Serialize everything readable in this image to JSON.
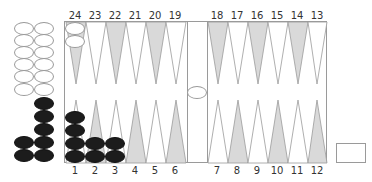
{
  "colors": {
    "gray_point": "#d9d9d9",
    "white_point": "#ffffff",
    "line": "#9a9a9a",
    "black_checker": "#1c1c1c",
    "white_checker": "#ffffff"
  },
  "top_labels": [
    "24",
    "23",
    "22",
    "21",
    "20",
    "19",
    "18",
    "17",
    "16",
    "15",
    "14",
    "13"
  ],
  "bottom_labels": [
    "1",
    "2",
    "3",
    "4",
    "5",
    "6",
    "7",
    "8",
    "9",
    "10",
    "11",
    "12"
  ],
  "position": {
    "point_24": {
      "color": "white",
      "count": 2
    },
    "point_1": {
      "color": "black",
      "count": 4
    },
    "point_2": {
      "color": "black",
      "count": 2
    },
    "point_3": {
      "color": "black",
      "count": 2
    },
    "bar": {
      "color": "white",
      "count": 1
    },
    "borne_off_white": 12,
    "borne_off_black": 7
  },
  "cube_box_label": ""
}
